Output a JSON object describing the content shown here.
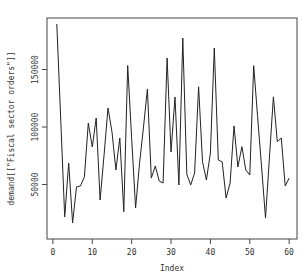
{
  "chart_data": {
    "type": "line",
    "title": "",
    "xlabel": "Index",
    "ylabel": "demand[[\"Fiscal sector orders\"]]",
    "x": [
      1,
      2,
      3,
      4,
      5,
      6,
      7,
      8,
      9,
      10,
      11,
      12,
      13,
      14,
      15,
      16,
      17,
      18,
      19,
      20,
      21,
      22,
      23,
      24,
      25,
      26,
      27,
      28,
      29,
      30,
      31,
      32,
      33,
      34,
      35,
      36,
      37,
      38,
      39,
      40,
      41,
      42,
      43,
      44,
      45,
      46,
      47,
      48,
      49,
      50,
      51,
      52,
      53,
      54,
      55,
      56,
      57,
      58,
      59,
      60
    ],
    "series": [
      {
        "name": "demand[[\"Fiscal sector orders\"]]",
        "values": [
          189600,
          105000,
          21700,
          68700,
          16500,
          47900,
          48800,
          56600,
          103500,
          82600,
          107800,
          36500,
          76000,
          116500,
          95600,
          62600,
          90400,
          26300,
          153500,
          91000,
          29600,
          68000,
          100000,
          133000,
          55600,
          66100,
          53000,
          51300,
          160000,
          78300,
          126100,
          49600,
          177400,
          59000,
          49600,
          60000,
          135000,
          69800,
          53900,
          77400,
          168700,
          71300,
          69600,
          38300,
          51300,
          101000,
          65200,
          82900,
          62600,
          58300,
          153300,
          109000,
          65000,
          20900,
          73000,
          126300,
          87200,
          90400,
          48700,
          55600
        ]
      }
    ],
    "xlim": [
      -1.5,
      62
    ],
    "ylim": [
      2600,
      194800
    ],
    "xticks": [
      0,
      10,
      20,
      30,
      40,
      50,
      60
    ],
    "xtick_labels": [
      "0",
      "10",
      "20",
      "30",
      "40",
      "50",
      "60"
    ],
    "yticks": [
      50000,
      100000,
      150000
    ],
    "ytick_labels": [
      "50000",
      "100000",
      "150000"
    ],
    "grid": false,
    "legend": "none",
    "line_color": "#222222"
  }
}
